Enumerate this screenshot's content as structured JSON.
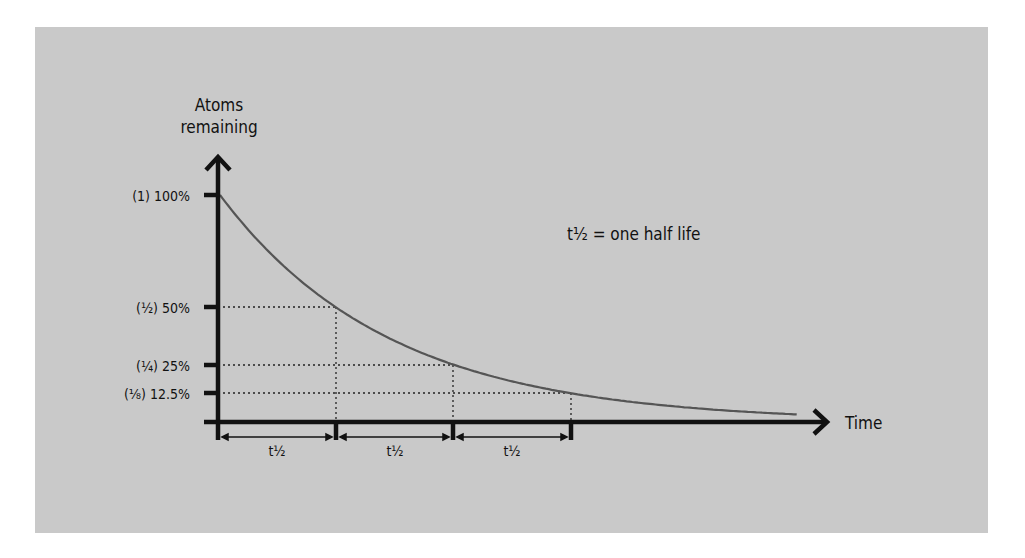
{
  "chart_data": {
    "type": "line",
    "title": "",
    "ylabel": "Atoms remaining",
    "ylabel_lines": [
      "Atoms",
      "remaining"
    ],
    "xlabel": "Time",
    "annotation": "t½ = one half life",
    "y_ticks": [
      {
        "label": "(1) 100%",
        "value": 100
      },
      {
        "label": "(½) 50%",
        "value": 50
      },
      {
        "label": "(¼) 25%",
        "value": 25
      },
      {
        "label": "(⅛) 12.5%",
        "value": 12.5
      }
    ],
    "x_intervals": [
      "t½",
      "t½",
      "t½"
    ],
    "x": [
      0,
      1,
      2,
      3,
      4.9
    ],
    "x_unit": "half-lives",
    "series": [
      {
        "name": "Atoms remaining",
        "values": [
          100,
          50,
          25,
          12.5,
          3.4
        ],
        "color": "#555555"
      }
    ],
    "ylim": [
      0,
      100
    ],
    "grid": false,
    "guide_lines": "dotted",
    "legend": "none"
  },
  "colors": {
    "background": "#ffffff",
    "panel": "#c9c9c9",
    "axis": "#111111",
    "curve": "#555555"
  }
}
